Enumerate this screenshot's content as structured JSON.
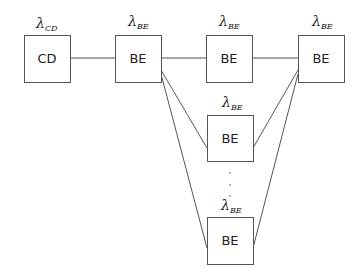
{
  "diagram": {
    "nodes": [
      {
        "id": "cd",
        "label": "CD",
        "rate_symbol": "λ",
        "rate_subscript": "CD",
        "x": 24,
        "y": 35,
        "w": 46,
        "h": 47
      },
      {
        "id": "be1",
        "label": "BE",
        "rate_symbol": "λ",
        "rate_subscript": "BE",
        "x": 115,
        "y": 35,
        "w": 46,
        "h": 47
      },
      {
        "id": "be2",
        "label": "BE",
        "rate_symbol": "λ",
        "rate_subscript": "BE",
        "x": 206,
        "y": 35,
        "w": 46,
        "h": 47
      },
      {
        "id": "be3",
        "label": "BE",
        "rate_symbol": "λ",
        "rate_subscript": "BE",
        "x": 298,
        "y": 35,
        "w": 46,
        "h": 47
      },
      {
        "id": "be4",
        "label": "BE",
        "rate_symbol": "λ",
        "rate_subscript": "BE",
        "x": 207,
        "y": 115,
        "w": 46,
        "h": 46
      },
      {
        "id": "be5",
        "label": "BE",
        "rate_symbol": "λ",
        "rate_subscript": "BE",
        "x": 207,
        "y": 217,
        "w": 46,
        "h": 47
      }
    ],
    "edges": [
      {
        "from": "cd",
        "to": "be1"
      },
      {
        "from": "be1",
        "to": "be2"
      },
      {
        "from": "be2",
        "to": "be3"
      },
      {
        "from": "be1",
        "to": "be4"
      },
      {
        "from": "be1",
        "to": "be5"
      },
      {
        "from": "be3",
        "to": "be4"
      },
      {
        "from": "be3",
        "to": "be5"
      }
    ],
    "ellipsis": "⋮"
  }
}
